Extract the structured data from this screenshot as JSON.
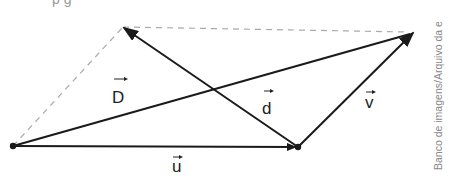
{
  "title_fragment": "p                  g",
  "vectors": {
    "u": {
      "label": "u",
      "from": [
        13,
        146
      ],
      "to": [
        298,
        147
      ]
    },
    "v": {
      "label": "v",
      "from": [
        298,
        147
      ],
      "to": [
        413,
        33
      ]
    },
    "D": {
      "label": "D",
      "from": [
        13,
        146
      ],
      "to": [
        413,
        33
      ]
    },
    "d": {
      "label": "d",
      "from": [
        298,
        147
      ],
      "to": [
        123,
        27
      ]
    }
  },
  "dashed_lines": [
    {
      "from": [
        13,
        146
      ],
      "to": [
        123,
        27
      ]
    },
    {
      "from": [
        123,
        27
      ],
      "to": [
        413,
        33
      ]
    }
  ],
  "credit": "Banco de imagens/Arquivo da e",
  "colors": {
    "vector": "#1a1a1a",
    "dashed": "#aaaaaa",
    "credit": "#888888"
  }
}
